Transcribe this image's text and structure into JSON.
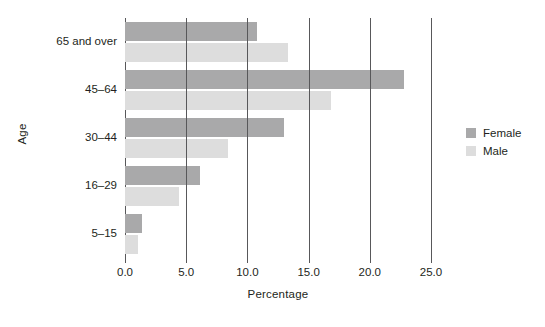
{
  "chart_data": {
    "type": "bar",
    "orientation": "horizontal",
    "title": "",
    "xlabel": "Percentage",
    "ylabel": "Age",
    "categories": [
      "5–15",
      "16–29",
      "30–44",
      "45–64",
      "65 and over"
    ],
    "series": [
      {
        "name": "Female",
        "color": "#a9a9aa",
        "values": [
          1.4,
          6.1,
          13.0,
          22.8,
          10.8
        ]
      },
      {
        "name": "Male",
        "color": "#dddddd",
        "values": [
          1.1,
          4.4,
          8.4,
          16.8,
          13.3
        ]
      }
    ],
    "xlim": [
      0.0,
      25.0
    ],
    "xticks": [
      "0.0",
      "5.0",
      "10.0",
      "15.0",
      "20.0",
      "25.0"
    ],
    "xtick_values": [
      0.0,
      5.0,
      10.0,
      15.0,
      20.0,
      25.0
    ],
    "grid": "vertical",
    "legend_position": "right",
    "legend": [
      "Female",
      "Male"
    ]
  },
  "axes": {
    "y_title": "Age",
    "x_title": "Percentage"
  },
  "legend": {
    "items": [
      {
        "label": "Female",
        "color": "#a9a9aa"
      },
      {
        "label": "Male",
        "color": "#dddddd"
      }
    ]
  },
  "colors": {
    "female": "#a9a9aa",
    "male": "#dddddd",
    "axis": "#58585a",
    "text": "#231f20",
    "background": "#ffffff"
  }
}
